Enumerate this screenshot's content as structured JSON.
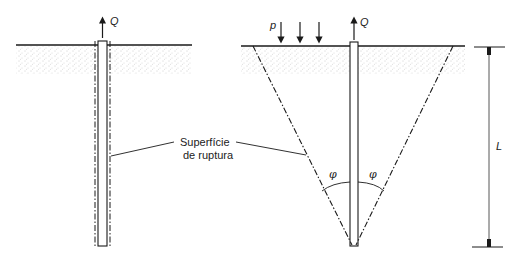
{
  "figure": {
    "left_panel": {
      "load_label": "Q",
      "description": "Straight pile with cylindrical rupture surface"
    },
    "right_panel": {
      "load_label": "Q",
      "surcharge_label": "p",
      "angle_left_label": "φ",
      "angle_right_label": "φ",
      "description": "Pile with conical rupture surface"
    },
    "callout": {
      "line1": "Superfície",
      "line2": "de ruptura"
    },
    "dimension": {
      "label": "L"
    },
    "colors": {
      "line": "#1a1a1a",
      "soil_dots": "#9a9a9a",
      "background": "#ffffff"
    }
  }
}
